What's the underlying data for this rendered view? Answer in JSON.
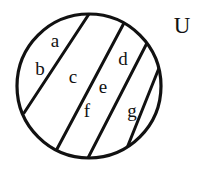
{
  "figure": {
    "type": "venn-partition-diagram",
    "stroke_color": "#111111",
    "fill_color": "#ffffff",
    "background_color": "#ffffff"
  },
  "universe": {
    "label": "U",
    "x": 182,
    "y": 28
  },
  "circle": {
    "name": "universal-set-circle",
    "cx": 89,
    "cy": 86,
    "r": 72,
    "stroke_width": 3.2
  },
  "dividers": [
    {
      "name": "divider-1",
      "x1": 89,
      "y1": 14,
      "x2": 24,
      "y2": 113
    },
    {
      "name": "divider-2",
      "x1": 124,
      "y1": 23,
      "x2": 57,
      "y2": 149
    },
    {
      "name": "divider-3",
      "x1": 147,
      "y1": 43,
      "x2": 88,
      "y2": 158
    },
    {
      "name": "divider-4",
      "x1": 159,
      "y1": 68,
      "x2": 127,
      "y2": 148
    }
  ],
  "regions": [
    {
      "id": "a",
      "label": "a",
      "x": 55,
      "y": 43
    },
    {
      "id": "b",
      "label": "b",
      "x": 40,
      "y": 71
    },
    {
      "id": "c",
      "label": "c",
      "x": 73,
      "y": 79
    },
    {
      "id": "d",
      "label": "d",
      "x": 123,
      "y": 61
    },
    {
      "id": "e",
      "label": "e",
      "x": 103,
      "y": 89
    },
    {
      "id": "f",
      "label": "f",
      "x": 87,
      "y": 113
    },
    {
      "id": "g",
      "label": "g",
      "x": 132,
      "y": 113
    }
  ]
}
